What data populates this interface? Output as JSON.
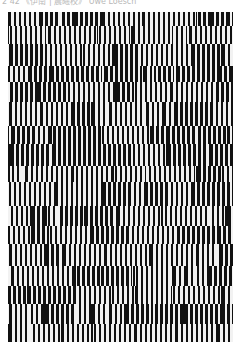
{
  "caption": "2 42  《伊南 | 晨曦校》  Uwe Loesch",
  "artwork": {
    "description": "Op-art poster composed of vertical black and white stripes with shifting horizontal bands",
    "colors": {
      "dark": "#111111",
      "light": "#f2f2f2",
      "background": "#ffffff",
      "caption": "#b8b8b8"
    },
    "stripe_period_px": 5,
    "bands": [
      {
        "top": 0,
        "height": 14,
        "phase": 0
      },
      {
        "top": 14,
        "height": 18,
        "phase": 2
      },
      {
        "top": 32,
        "height": 22,
        "phase": 1
      },
      {
        "top": 54,
        "height": 16,
        "phase": 3
      },
      {
        "top": 70,
        "height": 20,
        "phase": 0
      },
      {
        "top": 90,
        "height": 24,
        "phase": 2
      },
      {
        "top": 114,
        "height": 18,
        "phase": 4
      },
      {
        "top": 132,
        "height": 22,
        "phase": 1
      },
      {
        "top": 154,
        "height": 16,
        "phase": 3
      },
      {
        "top": 170,
        "height": 24,
        "phase": 0
      },
      {
        "top": 194,
        "height": 20,
        "phase": 2
      },
      {
        "top": 214,
        "height": 18,
        "phase": 4
      },
      {
        "top": 232,
        "height": 22,
        "phase": 1
      },
      {
        "top": 254,
        "height": 20,
        "phase": 3
      },
      {
        "top": 274,
        "height": 18,
        "phase": 0
      },
      {
        "top": 292,
        "height": 20,
        "phase": 2
      },
      {
        "top": 312,
        "height": 18,
        "phase": 1
      }
    ]
  }
}
